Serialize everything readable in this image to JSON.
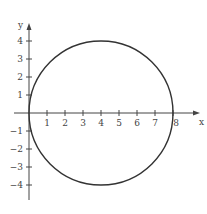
{
  "figure": {
    "x_label": "x",
    "y_label": "y",
    "x_ticks": [
      "1",
      "2",
      "3",
      "4",
      "5",
      "6",
      "7",
      "8"
    ],
    "y_ticks": [
      "4",
      "3",
      "2",
      "1",
      "−1",
      "−2",
      "−3",
      "−4"
    ],
    "circle": {
      "center_x": 4,
      "center_y": 0,
      "radius": 4,
      "color": "#333333"
    }
  }
}
